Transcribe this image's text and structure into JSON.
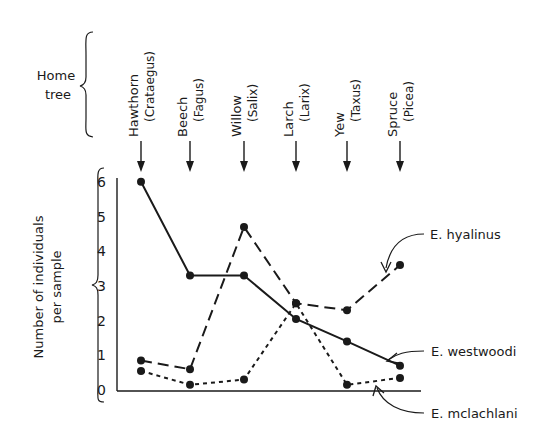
{
  "chart_data": {
    "type": "line",
    "title": "",
    "header_label": [
      "Home",
      "tree"
    ],
    "categories": [
      "Hawthorn",
      "Beech",
      "Willow",
      "Larch",
      "Yew",
      "Spruce"
    ],
    "category_latin": [
      "(Crataegus)",
      "(Fagus)",
      "(Salix)",
      "(Larix)",
      "(Taxus)",
      "(Picea)"
    ],
    "xlabel": "Home tree",
    "ylabel": [
      "Number of individuals",
      "per sample"
    ],
    "ylim": [
      0,
      6
    ],
    "yticks": [
      0,
      1,
      2,
      3,
      4,
      5,
      6
    ],
    "grid": false,
    "legend_position": "right, inline annotations with arrows",
    "series": [
      {
        "name": "E. hyalinus",
        "style": "long-dash",
        "values": [
          0.85,
          0.6,
          4.7,
          2.5,
          2.3,
          3.6
        ]
      },
      {
        "name": "E. westwoodi",
        "style": "solid",
        "values": [
          6.0,
          3.3,
          3.3,
          2.05,
          1.4,
          0.7
        ]
      },
      {
        "name": "E. mclachlani",
        "style": "short-dash",
        "values": [
          0.55,
          0.15,
          0.3,
          2.5,
          0.15,
          0.35
        ]
      }
    ]
  },
  "labels": {
    "home": "Home",
    "tree": "tree",
    "ylabel_line1": "Number of individuals",
    "ylabel_line2": "per sample",
    "legend_hyalinus": "E. hyalinus",
    "legend_westwoodi": "E. westwoodi",
    "legend_mclachlani": "E. mclachlani"
  },
  "colors": {
    "ink": "#1a1a1a",
    "background": "#ffffff"
  }
}
